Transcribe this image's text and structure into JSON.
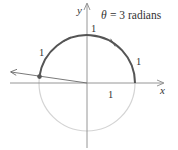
{
  "title": {
    "theta_symbol": "θ",
    "equals_text": "= 3 radians"
  },
  "axes": {
    "x_label": "x",
    "y_label": "y"
  },
  "arc_labels": [
    "1",
    "1",
    "1"
  ],
  "radius_label": "1",
  "colors": {
    "arc_dark": "#555555",
    "circle_light": "#d4d4d4",
    "axis": "#8a8a8a",
    "ray": "#6a6a6a",
    "text": "#333333"
  },
  "geometry": {
    "center": [
      87,
      83
    ],
    "radius": 48,
    "theta_radians": 3
  }
}
